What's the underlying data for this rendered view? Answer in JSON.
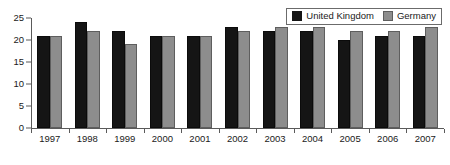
{
  "chart_data": {
    "type": "bar",
    "title": "",
    "subtitle": "",
    "xlabel": "",
    "ylabel": "",
    "categories": [
      "1997",
      "1998",
      "1999",
      "2000",
      "2001",
      "2002",
      "2003",
      "2004",
      "2005",
      "2006",
      "2007"
    ],
    "series": [
      {
        "name": "United Kingdom",
        "color": "#151515",
        "values": [
          21,
          24,
          22,
          21,
          21,
          23,
          22,
          22,
          20,
          21,
          21
        ]
      },
      {
        "name": "Germany",
        "color": "#8d8d8d",
        "values": [
          21,
          22,
          19,
          21,
          21,
          22,
          23,
          23,
          22,
          22,
          23
        ]
      }
    ],
    "ylim": [
      0,
      25
    ],
    "ytick_values": [
      0,
      5,
      10,
      15,
      20,
      25
    ],
    "ytick_labels": [
      "0",
      "5",
      "10",
      "15",
      "20",
      "25"
    ],
    "grid": false,
    "legend_position": "top-right",
    "legend_entries": [
      {
        "label": "United Kingdom",
        "swatch": "black-square-icon"
      },
      {
        "label": "Germany",
        "swatch": "gray-square-icon"
      }
    ]
  }
}
